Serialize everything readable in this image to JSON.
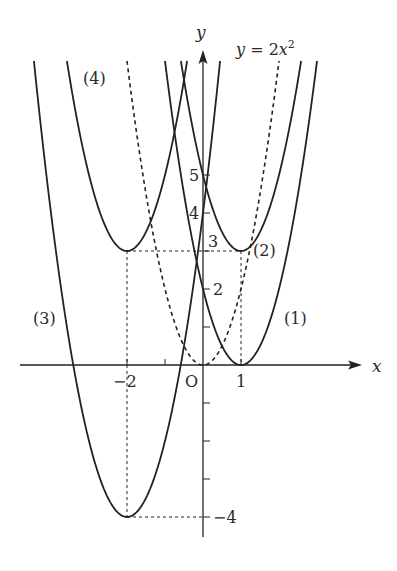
{
  "diagram": {
    "type": "function-graph",
    "axes": {
      "x_label": "x",
      "y_label": "y",
      "origin_label": "O",
      "x_ticks": [
        {
          "value": -2,
          "label": "-2"
        },
        {
          "value": -1,
          "label": ""
        },
        {
          "value": 1,
          "label": "1"
        }
      ],
      "y_ticks": [
        {
          "value": 5,
          "label": "5"
        },
        {
          "value": 4,
          "label": "4"
        },
        {
          "value": 3,
          "label": "3"
        },
        {
          "value": 2,
          "label": "2"
        },
        {
          "value": 1,
          "label": ""
        },
        {
          "value": -1,
          "label": ""
        },
        {
          "value": -2,
          "label": ""
        },
        {
          "value": -3,
          "label": ""
        },
        {
          "value": -4,
          "label": "-4"
        }
      ],
      "x_range": [
        -4.9,
        4.2
      ],
      "y_range": [
        -4.5,
        8.3
      ]
    },
    "base_curve": {
      "label": "y = 2x²",
      "a": 2,
      "h": 0,
      "k": 0,
      "style": "dashed"
    },
    "curves": [
      {
        "id": "1",
        "label": "(1)",
        "a": 2,
        "h": 1,
        "k": 0,
        "vertex": [
          1,
          0
        ]
      },
      {
        "id": "2",
        "label": "(2)",
        "a": 2,
        "h": 1,
        "k": 3,
        "vertex": [
          1,
          3
        ]
      },
      {
        "id": "3",
        "label": "(3)",
        "a": 2,
        "h": -2,
        "k": -4,
        "vertex": [
          -2,
          -4
        ]
      },
      {
        "id": "4",
        "label": "(4)",
        "a": 2,
        "h": -2,
        "k": 3,
        "vertex": [
          -2,
          3
        ]
      }
    ],
    "guide_lines": [
      {
        "from": [
          -2,
          3
        ],
        "to": [
          1,
          3
        ]
      },
      {
        "from": [
          -2,
          3
        ],
        "to": [
          -2,
          0
        ]
      },
      {
        "from": [
          1,
          3
        ],
        "to": [
          1,
          0
        ]
      },
      {
        "from": [
          -2,
          0
        ],
        "to": [
          -2,
          -4
        ]
      },
      {
        "from": [
          -2,
          -4
        ],
        "to": [
          0,
          -4
        ]
      }
    ],
    "colors": {
      "line": "#222222",
      "text": "#2a2a2a",
      "background": "#ffffff"
    }
  }
}
